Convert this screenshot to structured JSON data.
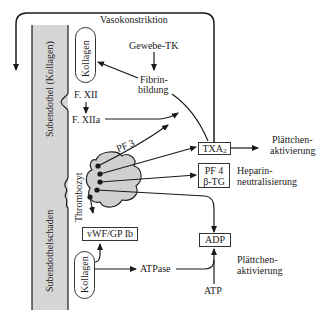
{
  "diagram": {
    "type": "flow",
    "title": "",
    "nodes": {
      "vasokonstriktion": "Vasokonstriktion",
      "gewebe_tk": "Gewebe-TK",
      "fibrinbildung_1": "Fibrin-",
      "fibrinbildung_2": "bildung",
      "kollagen_top": "Kollagen",
      "f_xii": "F. XII",
      "f_xiia": "F. XIIa",
      "pf3": "PF 3",
      "txa2_main": "TXA",
      "txa2_sub": "2",
      "plaettchen_aktivierung_1_a": "Plättchen-",
      "plaettchen_aktivierung_1_b": "aktivierung",
      "pf4": "PF 4",
      "btg": "β-TG",
      "heparin_1": "Heparin-",
      "heparin_2": "neutralisierung",
      "thrombozyt": "Thrombozyt",
      "vwf_gp": "vWF/GP Ib",
      "adp": "ADP",
      "kollagen_bottom": "Kollagen",
      "atpase": "ATPase",
      "atp": "ATP",
      "plaettchen_aktivierung_2_a": "Plättchen-",
      "plaettchen_aktivierung_2_b": "aktivierung"
    },
    "wall_labels": {
      "subendothel": "Subendothel (Kollagen)",
      "schaden": "Subendothelschaden"
    },
    "edges": [
      {
        "from": "TXA2",
        "to": "Vasokonstriktion (loop back down left)"
      },
      {
        "from": "Gewebe-TK",
        "to": "Fibrinbildung"
      },
      {
        "from": "Fibrinbildung",
        "to": "Kollagen (top)"
      },
      {
        "from": "Fibrinbildung",
        "to": "TXA2"
      },
      {
        "from": "F. XII",
        "to": "F. XIIa"
      },
      {
        "from": "F. XIIa",
        "to": "Fibrinbildung"
      },
      {
        "from": "Thrombozyt (PF 3)",
        "to": "Fibrinbildung"
      },
      {
        "from": "Thrombozyt",
        "to": "TXA2"
      },
      {
        "from": "Thrombozyt",
        "to": "PF 4 / β-TG"
      },
      {
        "from": "Thrombozyt",
        "to": "ADP"
      },
      {
        "from": "Thrombozyt",
        "to": "vWF/GP Ib"
      },
      {
        "from": "TXA2",
        "to": "Plättchenaktivierung"
      },
      {
        "from": "Kollagen (bottom)",
        "to": "vWF/GP Ib"
      },
      {
        "from": "Kollagen (bottom)",
        "to": "ATPase"
      },
      {
        "from": "ATPase",
        "to": "ADP"
      },
      {
        "from": "ATP",
        "to": "ADP"
      }
    ],
    "colors": {
      "wall_fill": "#d4d4d4",
      "line": "#1a1a1a",
      "platelet_fill": "#d0d0d0"
    }
  }
}
